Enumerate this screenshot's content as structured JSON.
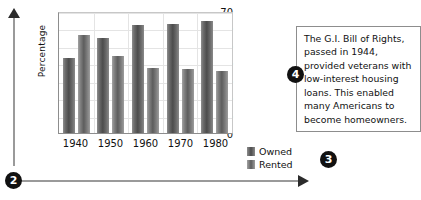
{
  "chart_data": {
    "type": "bar",
    "title": "",
    "xlabel": "",
    "ylabel": "Percentage",
    "categories": [
      "1940",
      "1950",
      "1960",
      "1970",
      "1980"
    ],
    "series": [
      {
        "name": "Owned",
        "values": [
          43,
          54.5,
          62,
          62.5,
          64.5
        ]
      },
      {
        "name": "Rented",
        "values": [
          56,
          44,
          37.5,
          36.5,
          35.5
        ]
      }
    ],
    "ylim": [
      0,
      70
    ],
    "yticks": [
      0,
      10,
      20,
      30,
      40,
      50,
      60,
      70
    ],
    "grid": true,
    "legend_position": "right-bottom"
  },
  "legend": {
    "items": [
      {
        "label": "Owned",
        "color": "#4c4c4c"
      },
      {
        "label": "Rented",
        "color": "#5d5d5d"
      }
    ]
  },
  "callout": {
    "text": "The G.I. Bill of Rights, passed in 1944, provided veterans with low-interest housing loans. This enabled many Americans to become homeowners."
  },
  "markers": {
    "axes_marker": "2",
    "legend_marker": "3",
    "callout_marker": "4"
  }
}
